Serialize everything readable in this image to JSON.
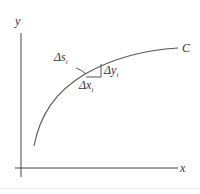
{
  "diagram": {
    "type": "arc-length-element",
    "axes": {
      "x_label": "x",
      "y_label": "y"
    },
    "curve": {
      "label": "C",
      "stroke": "#555555"
    },
    "element": {
      "arc_label": "Δs",
      "arc_subscript": "i",
      "dx_label": "Δx",
      "dx_subscript": "i",
      "dy_label": "Δy",
      "dy_subscript": "i"
    },
    "colors": {
      "axis": "#444444",
      "curve": "#555555",
      "text": "#333333",
      "divider": "#e6e6e6"
    }
  }
}
